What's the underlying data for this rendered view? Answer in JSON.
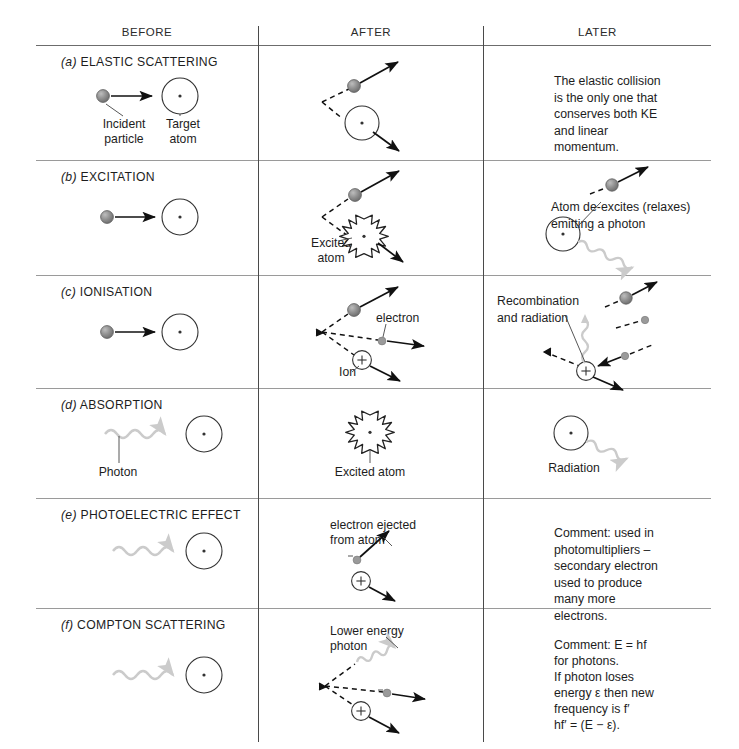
{
  "figure": {
    "columns": [
      "BEFORE",
      "AFTER",
      "LATER"
    ],
    "rows": [
      {
        "id": "elastic-scattering",
        "label_prefix": "(a)",
        "label": "ELASTIC SCATTERING",
        "before_labels": [
          "Incident\nparticle",
          "Target\natom"
        ],
        "after_labels": [],
        "later_note": "The elastic collision\nis the only one that\nconserves both KE\nand linear\nmomentum."
      },
      {
        "id": "excitation",
        "label_prefix": "(b)",
        "label": "EXCITATION",
        "before_labels": [],
        "after_labels": [
          "Excited\natom"
        ],
        "later_note": "Atom de-excites (relaxes)\nemitting a photon"
      },
      {
        "id": "ionisation",
        "label_prefix": "(c)",
        "label": "IONISATION",
        "before_labels": [],
        "after_labels": [
          "electron",
          "Ion"
        ],
        "later_note": "Recombination\nand radiation"
      },
      {
        "id": "absorption",
        "label_prefix": "(d)",
        "label": "ABSORPTION",
        "before_labels": [
          "Photon"
        ],
        "after_labels": [
          "Excited atom"
        ],
        "later_note": "Radiation"
      },
      {
        "id": "photoelectric-effect",
        "label_prefix": "(e)",
        "label": "PHOTOELECTRIC EFFECT",
        "before_labels": [],
        "after_labels": [
          "electron ejected\nfrom atom"
        ],
        "later_note": "Comment: used in\nphotomultipliers –\nsecondary electron\nused to produce\nmany more\nelectrons."
      },
      {
        "id": "compton-scattering",
        "label_prefix": "(f)",
        "label": "COMPTON  SCATTERING",
        "before_labels": [],
        "after_labels": [
          "Lower energy\nphoton"
        ],
        "later_note_lines": [
          "Comment: E = hf",
          "for photons.",
          "If photon loses",
          "energy ε then new",
          "frequency is f′",
          "hf′ = (E − ε)."
        ]
      }
    ],
    "symbols": {
      "ion_charge": "+",
      "electron_dash": "–",
      "nucleus_dot": "·"
    },
    "colors": {
      "ink": "#1d1d1d",
      "rule": "#9a9a9a",
      "divider": "#4a4a4a",
      "particle_fill": "#8a8a8a",
      "electron_fill": "#9a9a9a",
      "photon": "#c9c9c9"
    }
  }
}
